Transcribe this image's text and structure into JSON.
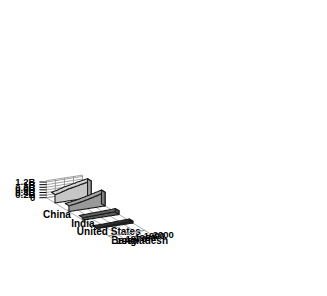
{
  "chart_data": {
    "type": "area",
    "title": "",
    "subtitle": "",
    "xlabel": "",
    "ylabel": "",
    "zlabel": "",
    "projection": "3d-ribbon",
    "grid": true,
    "legend_position": "in-place-axis-labels",
    "x": [
      1960,
      1965,
      1970,
      1975,
      1980,
      1985,
      1990,
      1995,
      2000
    ],
    "x_tick_labels": [
      "1960",
      "1970",
      "1980",
      "1990",
      "2000"
    ],
    "y_tick_labels": [
      "0",
      "0.2B",
      "0.4B",
      "0.6B",
      "0.8B",
      "1B",
      "1.2B"
    ],
    "y_tick_values": [
      0,
      200000000,
      400000000,
      600000000,
      800000000,
      1000000000,
      1200000000
    ],
    "ylim": [
      0,
      1300000000
    ],
    "xlim": [
      1960,
      2000
    ],
    "series": [
      {
        "name": "China",
        "color": "#c6c6c6",
        "values": [
          650000000,
          715000000,
          820000000,
          920000000,
          985000000,
          1055000000,
          1140000000,
          1205000000,
          1260000000
        ]
      },
      {
        "name": "India",
        "color": "#999999",
        "values": [
          445000000,
          495000000,
          555000000,
          620000000,
          695000000,
          780000000,
          870000000,
          960000000,
          1045000000
        ]
      },
      {
        "name": "United States",
        "color": "#5c5c5c",
        "values": [
          181000000,
          194000000,
          205000000,
          216000000,
          227000000,
          238000000,
          250000000,
          266000000,
          282000000
        ]
      },
      {
        "name": "Bangladesh",
        "color": "#2b2b2b",
        "values": [
          50000000,
          58000000,
          66000000,
          76000000,
          88000000,
          101000000,
          116000000,
          128000000,
          140000000
        ]
      }
    ]
  },
  "axes": {
    "value_axis_name": "population-axis",
    "category_axis_name": "country-axis",
    "time_axis_name": "year-axis"
  },
  "labels": {
    "countries": [
      "China",
      "India",
      "United States",
      "Bangladesh"
    ],
    "years": [
      "1960",
      "1970",
      "1980",
      "1990",
      "2000"
    ],
    "values": [
      "1.2B",
      "1B",
      "0.8B",
      "0.6B",
      "0.4B",
      "0.2B",
      "0"
    ]
  },
  "colors": {
    "background": "#ffffff",
    "grid": "#8a8a8a",
    "outline": "#1a1a1a",
    "text": "#000000",
    "china": "#c6c6c6",
    "india": "#999999",
    "united_states": "#5c5c5c",
    "bangladesh": "#2b2b2b"
  }
}
